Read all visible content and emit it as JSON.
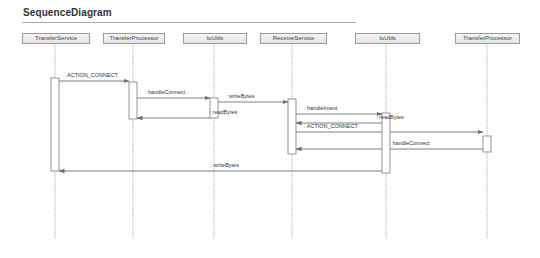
{
  "diagram": {
    "title": "SequenceDiagram",
    "participants": [
      {
        "id": "p0",
        "label": "TransferService"
      },
      {
        "id": "p1",
        "label": "TransferProcessor"
      },
      {
        "id": "p2",
        "label": "IoUtils"
      },
      {
        "id": "p3",
        "label": "ReceiveService"
      },
      {
        "id": "p4",
        "label": "IoUtils"
      },
      {
        "id": "p5",
        "label": "TransferProcessor"
      }
    ],
    "messages": [
      {
        "from": 0,
        "to": 1,
        "label": "ACTION_CONNECT",
        "style": "solid"
      },
      {
        "from": 1,
        "to": 2,
        "label": ": handleConnect",
        "style": "solid"
      },
      {
        "from": 2,
        "to": 1,
        "label": ": readBytes",
        "style": "return"
      },
      {
        "from": 2,
        "to": 3,
        "label": ": writeBytes",
        "style": "solid"
      },
      {
        "from": 3,
        "to": 4,
        "label": ": handleIntent",
        "style": "solid"
      },
      {
        "from": 4,
        "to": 3,
        "label": ": readBytes",
        "style": "return"
      },
      {
        "from": 3,
        "to": 5,
        "label": ": ACTION_CONNECT",
        "style": "solid"
      },
      {
        "from": 5,
        "to": 3,
        "label": ": handleConnect",
        "style": "return"
      },
      {
        "from": 4,
        "to": 0,
        "label": ": writeBytes",
        "style": "return"
      }
    ],
    "colors": {
      "line": "#707070",
      "lifeline": "#9a9a9a",
      "activation_fill": "#ffffff",
      "activation_border": "#7a7a7a"
    }
  }
}
